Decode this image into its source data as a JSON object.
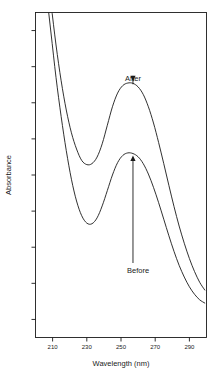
{
  "chart_data": {
    "type": "line",
    "title": "",
    "xlabel": "Wavelength (nm)",
    "ylabel": "Absorbance",
    "xlim": [
      200,
      300
    ],
    "ylim": [
      0,
      1
    ],
    "grid": false,
    "legend_position": "none",
    "xticks": [
      210,
      230,
      250,
      270,
      290
    ],
    "xtick_labels": [
      "210",
      "230",
      "250",
      "270",
      "290"
    ],
    "ytick_count": 9,
    "ytick_labels": [],
    "annotations": [
      {
        "text": "After",
        "points_to_series": "After",
        "x": 257,
        "arrow_direction": "down",
        "label_x": 257,
        "label_y": 0.79
      },
      {
        "text": "Before",
        "points_to_series": "Before",
        "x": 257,
        "arrow_direction": "up",
        "label_x": 260,
        "label_y": 0.2
      }
    ],
    "series": [
      {
        "name": "After",
        "color": "#1a1a1a",
        "x": [
          203,
          206,
          209,
          212,
          215,
          218,
          221,
          224,
          227,
          230,
          233,
          236,
          239,
          242,
          245,
          248,
          251,
          254,
          257,
          260,
          263,
          266,
          269,
          272,
          275,
          278,
          281,
          284,
          287,
          290,
          293,
          296,
          299
        ],
        "y": [
          1.28,
          1.16,
          1.03,
          0.9,
          0.79,
          0.7,
          0.63,
          0.58,
          0.545,
          0.532,
          0.535,
          0.555,
          0.596,
          0.653,
          0.71,
          0.752,
          0.775,
          0.783,
          0.782,
          0.771,
          0.748,
          0.71,
          0.66,
          0.6,
          0.535,
          0.468,
          0.403,
          0.343,
          0.29,
          0.243,
          0.203,
          0.17,
          0.146
        ]
      },
      {
        "name": "Before",
        "color": "#1a1a1a",
        "x": [
          203,
          206,
          209,
          212,
          215,
          218,
          221,
          224,
          227,
          230,
          233,
          236,
          239,
          242,
          245,
          248,
          251,
          254,
          257,
          260,
          263,
          266,
          269,
          272,
          275,
          278,
          281,
          284,
          287,
          290,
          293,
          296,
          299
        ],
        "y": [
          1.22,
          1.08,
          0.94,
          0.8,
          0.68,
          0.575,
          0.487,
          0.42,
          0.375,
          0.352,
          0.35,
          0.368,
          0.405,
          0.452,
          0.5,
          0.538,
          0.56,
          0.568,
          0.566,
          0.556,
          0.535,
          0.503,
          0.462,
          0.415,
          0.364,
          0.313,
          0.265,
          0.222,
          0.186,
          0.156,
          0.133,
          0.116,
          0.106
        ]
      }
    ]
  }
}
